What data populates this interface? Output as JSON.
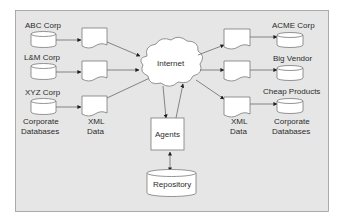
{
  "diagram": {
    "colors": {
      "frame_fill": "#e6e6e6",
      "frame_stroke": "#9a9a9a",
      "shape_fill": "#ffffff",
      "shape_stroke": "#7a7a7a",
      "text": "#2b2b2b"
    },
    "left_sources": [
      {
        "label": "ABC Corp"
      },
      {
        "label": "L&M Corp"
      },
      {
        "label": "XYZ Corp"
      }
    ],
    "left_caption": {
      "line1": "Corporate",
      "line2": "Databases"
    },
    "left_docs_caption": {
      "line1": "XML",
      "line2": "Data"
    },
    "center": {
      "cloud_label": "Internet",
      "agents_label": "Agents",
      "repository_label": "Repository"
    },
    "right_targets": [
      {
        "label": "ACME Corp"
      },
      {
        "label": "Big Vendor"
      },
      {
        "label": "Cheap Products"
      }
    ],
    "right_docs_caption": {
      "line1": "XML",
      "line2": "Data"
    },
    "right_caption": {
      "line1": "Corporate",
      "line2": "Databases"
    }
  }
}
